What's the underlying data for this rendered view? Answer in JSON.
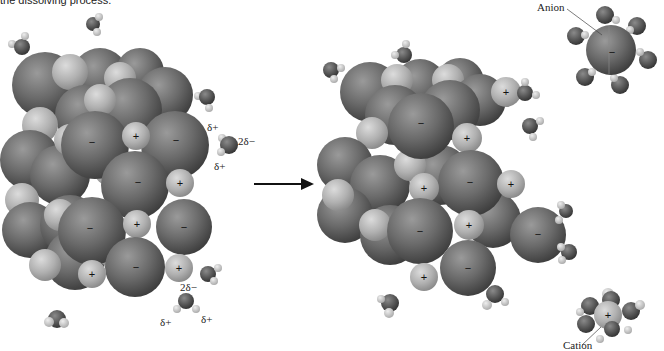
{
  "caption": "the dissolving process.",
  "labels": {
    "anion": "Anion",
    "cation": "Cation",
    "delta_plus": "δ+",
    "two_delta_minus": "2δ−"
  },
  "symbols": {
    "plus": "+",
    "minus": "−"
  },
  "colors": {
    "anion": "#6e6e6e",
    "cation": "#b5b5b5",
    "oxygen": "#5a5a5a",
    "hydrogen": "#c8c8c8",
    "arrow": "#111111",
    "background": "#ffffff"
  },
  "arrow": {
    "direction": "right",
    "meaning": "dissolving"
  },
  "panels": [
    {
      "name": "ionic-solid-before",
      "description": "Ionic crystal lattice with surrounding water molecules"
    },
    {
      "name": "ionic-solid-dissolving",
      "description": "Ions leaving lattice, hydrated by water molecules"
    },
    {
      "name": "hydrated-ions",
      "items": [
        "Anion",
        "Cation"
      ]
    }
  ]
}
